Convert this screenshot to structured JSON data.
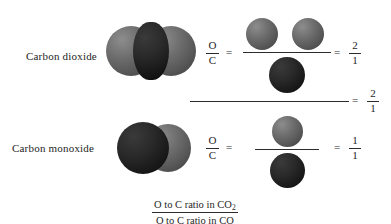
{
  "diagram": {
    "title_caption": {
      "numerator_prefix": "O to C ratio in CO",
      "numerator_subscript": "2",
      "denominator": "O to C ratio in CO"
    },
    "rows": [
      {
        "name": "carbon-dioxide-row",
        "molecule_label": "Carbon dioxide",
        "molecule_formula": "CO2",
        "molecule_atoms": [
          "O",
          "C",
          "O"
        ],
        "ratio_symbol_numerator": "O",
        "ratio_symbol_denominator": "C",
        "equals_1": "=",
        "equals_2": "=",
        "sphere_fraction": {
          "numerator_atoms": [
            "O",
            "O"
          ],
          "denominator_atoms": [
            "C"
          ],
          "numerator_count": 2,
          "denominator_count": 1
        },
        "result_numerator": "2",
        "result_denominator": "1"
      },
      {
        "name": "carbon-monoxide-row",
        "molecule_label": "Carbon monoxide",
        "molecule_formula": "CO",
        "molecule_atoms": [
          "C",
          "O"
        ],
        "ratio_symbol_numerator": "O",
        "ratio_symbol_denominator": "C",
        "equals_1": "=",
        "equals_2": "=",
        "sphere_fraction": {
          "numerator_atoms": [
            "O"
          ],
          "denominator_atoms": [
            "C"
          ],
          "numerator_count": 1,
          "denominator_count": 1
        },
        "result_numerator": "1",
        "result_denominator": "1"
      }
    ],
    "overall": {
      "equals": "=",
      "result_numerator": "2",
      "result_denominator": "1"
    },
    "colors": {
      "oxygen_sphere": "#565656",
      "carbon_sphere": "#1a1a1a",
      "line": "#2b2b2b",
      "text": "#1e1e1e",
      "background": "#ffffff"
    }
  }
}
